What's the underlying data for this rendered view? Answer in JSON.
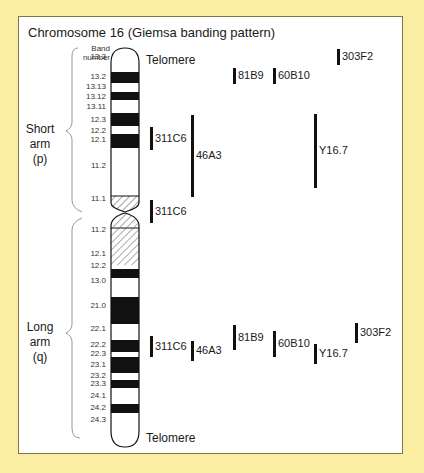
{
  "title": "Chromosome 16 (Giemsa banding pattern)",
  "band_header": [
    "Band",
    "number"
  ],
  "telomere_top": "Telomere",
  "telomere_bottom": "Telomere",
  "short_arm": [
    "Short",
    "arm",
    "(p)"
  ],
  "long_arm": [
    "Long",
    "arm",
    "(q)"
  ],
  "colors": {
    "background": "#fbeea2",
    "panel": "#ffffff",
    "border": "#7d7450",
    "band": "#111111"
  },
  "bands": [
    {
      "label": "13.3",
      "y": 57
    },
    {
      "label": "13.2",
      "y": 77
    },
    {
      "label": "13.13",
      "y": 87
    },
    {
      "label": "13.12",
      "y": 97
    },
    {
      "label": "13.11",
      "y": 107
    },
    {
      "label": "12.3",
      "y": 120
    },
    {
      "label": "12.2",
      "y": 131
    },
    {
      "label": "12.1",
      "y": 140
    },
    {
      "label": "11.2",
      "y": 166
    },
    {
      "label": "11.1",
      "y": 199
    },
    {
      "label": "11.2",
      "y": 230
    },
    {
      "label": "12.1",
      "y": 254
    },
    {
      "label": "12.2",
      "y": 266
    },
    {
      "label": "13.0",
      "y": 281
    },
    {
      "label": "21.0",
      "y": 306
    },
    {
      "label": "22.1",
      "y": 329
    },
    {
      "label": "22.2",
      "y": 345
    },
    {
      "label": "22.3",
      "y": 354
    },
    {
      "label": "23.1",
      "y": 365
    },
    {
      "label": "23.2",
      "y": 376
    },
    {
      "label": "23.3",
      "y": 384
    },
    {
      "label": "24.1",
      "y": 396
    },
    {
      "label": "24.2",
      "y": 408
    },
    {
      "label": "24.3",
      "y": 420
    }
  ],
  "probes_upper": [
    {
      "label": "303F2",
      "x": 337,
      "y1": 49,
      "y2": 65
    },
    {
      "label": "81B9",
      "x": 233,
      "y1": 68,
      "y2": 84
    },
    {
      "label": "60B10",
      "x": 273,
      "y1": 68,
      "y2": 84
    },
    {
      "label": "311C6",
      "x": 150,
      "y1": 127,
      "y2": 150
    },
    {
      "label": "46A3",
      "x": 191,
      "y1": 115,
      "y2": 197
    },
    {
      "label": "Y16.7",
      "x": 314,
      "y1": 114,
      "y2": 188
    },
    {
      "label": "311C6",
      "x": 150,
      "y1": 200,
      "y2": 223
    }
  ],
  "probes_lower": [
    {
      "label": "311C6",
      "x": 150,
      "y1": 336,
      "y2": 357
    },
    {
      "label": "46A3",
      "x": 191,
      "y1": 341,
      "y2": 361
    },
    {
      "label": "81B9",
      "x": 233,
      "y1": 325,
      "y2": 350
    },
    {
      "label": "60B10",
      "x": 273,
      "y1": 331,
      "y2": 357
    },
    {
      "label": "Y16.7",
      "x": 314,
      "y1": 344,
      "y2": 364
    },
    {
      "label": "303F2",
      "x": 355,
      "y1": 323,
      "y2": 343
    }
  ]
}
